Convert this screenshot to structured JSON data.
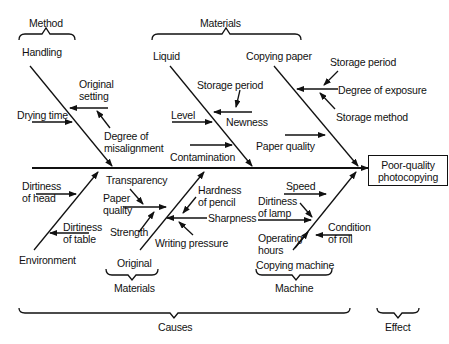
{
  "diagram": {
    "type": "fishbone",
    "effect": {
      "line1": "Poor-quality",
      "line2": "photocopying"
    },
    "groups": {
      "causes": "Causes",
      "effect": "Effect",
      "method": "Method",
      "materials_top": "Materials",
      "original": "Original",
      "materials_bottom": "Materials",
      "machine": "Machine"
    },
    "bones": {
      "handling": {
        "label": "Handling",
        "causes": [
          {
            "label": "Original",
            "label2": "setting"
          },
          {
            "label": "Drying time"
          },
          {
            "label": "Degree of",
            "label2": "misalignment"
          }
        ]
      },
      "liquid": {
        "label": "Liquid",
        "causes": [
          {
            "label": "Storage period"
          },
          {
            "label": "Level"
          },
          {
            "label": "Newness"
          },
          {
            "label": "Contamination"
          }
        ]
      },
      "copying_paper": {
        "label": "Copying paper",
        "causes": [
          {
            "label": "Storage period"
          },
          {
            "label": "Degree of exposure"
          },
          {
            "label": "Storage method"
          },
          {
            "label": "Paper quality"
          }
        ]
      },
      "environment": {
        "label": "Environment",
        "causes": [
          {
            "label": "Dirtiness",
            "label2": "of head"
          },
          {
            "label": "Dirtiness",
            "label2": "of table"
          }
        ]
      },
      "original": {
        "label": "Original",
        "causes": [
          {
            "label": "Transparency"
          },
          {
            "label": "Paper",
            "label2": "quality"
          },
          {
            "label": "Strength"
          }
        ]
      },
      "pencil": {
        "causes": [
          {
            "label": "Hardness",
            "label2": "of pencil"
          },
          {
            "label": "Sharpness"
          },
          {
            "label": "Writing pressure"
          }
        ]
      },
      "copying_machine": {
        "label": "Copying machine",
        "causes": [
          {
            "label": "Speed"
          },
          {
            "label": "Dirtiness",
            "label2": "of lamp"
          },
          {
            "label": "Operating",
            "label2": "hours"
          },
          {
            "label": "Condition",
            "label2": "of roll"
          }
        ]
      }
    }
  }
}
